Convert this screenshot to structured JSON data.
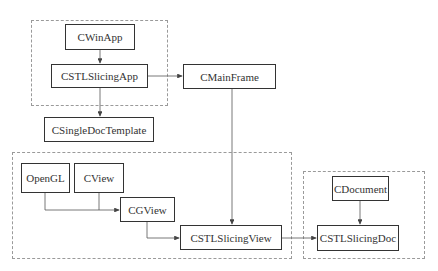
{
  "diagram": {
    "groups": [
      {
        "id": "app-group",
        "x": 31,
        "y": 20,
        "w": 137,
        "h": 86
      },
      {
        "id": "view-group",
        "x": 12,
        "y": 152,
        "w": 280,
        "h": 107
      },
      {
        "id": "doc-group",
        "x": 303,
        "y": 171,
        "w": 122,
        "h": 88
      }
    ],
    "nodes": [
      {
        "id": "cwinapp",
        "label": "CWinApp",
        "x": 65,
        "y": 24,
        "w": 70,
        "h": 26
      },
      {
        "id": "cstlslicingapp",
        "label": "CSTLSlicingApp",
        "x": 51,
        "y": 64,
        "w": 97,
        "h": 24
      },
      {
        "id": "cmainframe",
        "label": "CMainFrame",
        "x": 183,
        "y": 64,
        "w": 93,
        "h": 25
      },
      {
        "id": "csingledoctemplate",
        "label": "CSingleDocTemplate",
        "x": 44,
        "y": 117,
        "w": 110,
        "h": 25
      },
      {
        "id": "opengl",
        "label": "OpenGL",
        "x": 21,
        "y": 163,
        "w": 49,
        "h": 30
      },
      {
        "id": "cview",
        "label": "CView",
        "x": 74,
        "y": 163,
        "w": 50,
        "h": 30
      },
      {
        "id": "cgview",
        "label": "CGView",
        "x": 120,
        "y": 197,
        "w": 55,
        "h": 25
      },
      {
        "id": "cstlslicingview",
        "label": "CSTLSlicingView",
        "x": 180,
        "y": 225,
        "w": 102,
        "h": 25
      },
      {
        "id": "cdocument",
        "label": "CDocument",
        "x": 332,
        "y": 176,
        "w": 57,
        "h": 25
      },
      {
        "id": "cstlslicingdoc",
        "label": "CSTLSlicingDoc",
        "x": 317,
        "y": 225,
        "w": 82,
        "h": 26
      }
    ],
    "edges": [
      {
        "from": "cwinapp",
        "to": "cstlslicingapp"
      },
      {
        "from": "cstlslicingapp",
        "to": "cmainframe"
      },
      {
        "from": "cstlslicingapp",
        "to": "csingledoctemplate"
      },
      {
        "from": "cmainframe",
        "to": "cstlslicingview"
      },
      {
        "from": "opengl",
        "to": "cgview"
      },
      {
        "from": "cview",
        "to": "cgview"
      },
      {
        "from": "cgview",
        "to": "cstlslicingview"
      },
      {
        "from": "cstlslicingview",
        "to": "cstlslicingdoc"
      },
      {
        "from": "cdocument",
        "to": "cstlslicingdoc"
      }
    ]
  }
}
